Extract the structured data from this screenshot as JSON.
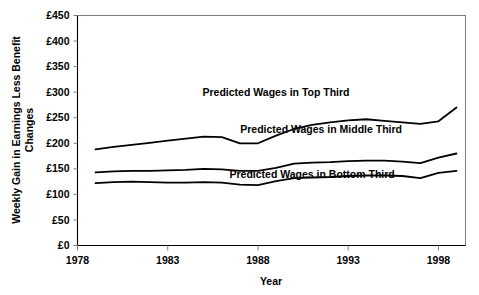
{
  "chart_data": {
    "type": "line",
    "title": "",
    "xlabel": "Year",
    "ylabel": "Weekly Gain in Earnings Less Benefit Changes",
    "ylabel_line1": "Weekly Gain in Earnings Less Benefit",
    "ylabel_line2": "Changes",
    "xlim": [
      1978,
      1999.5
    ],
    "ylim": [
      0,
      450
    ],
    "grid": false,
    "legend_position": "inline-annotations",
    "x_tick_labels": [
      "1978",
      "1983",
      "1988",
      "1993",
      "1998"
    ],
    "x_ticks": [
      1978,
      1983,
      1988,
      1993,
      1998
    ],
    "y_tick_labels": [
      "£0",
      "£50",
      "£100",
      "£150",
      "£200",
      "£250",
      "£300",
      "£350",
      "£400",
      "£450"
    ],
    "y_ticks": [
      0,
      50,
      100,
      150,
      200,
      250,
      300,
      350,
      400,
      450
    ],
    "currency_symbol": "£",
    "x": [
      1979,
      1980,
      1981,
      1982,
      1983,
      1984,
      1985,
      1986,
      1987,
      1988,
      1989,
      1990,
      1991,
      1992,
      1993,
      1994,
      1995,
      1996,
      1997,
      1998,
      1999
    ],
    "series": [
      {
        "name": "Predicted Wages in Top Third",
        "annotation": "Predicted Wages in Top Third",
        "color": "#000000",
        "values": [
          188,
          193,
          197,
          201,
          205,
          209,
          213,
          212,
          200,
          200,
          215,
          228,
          236,
          241,
          245,
          247,
          244,
          241,
          238,
          243,
          270
        ]
      },
      {
        "name": "Predicted Wages in Middle Third",
        "annotation": "Predicted Wages in Middle Third",
        "color": "#000000",
        "values": [
          143,
          145,
          146,
          146,
          147,
          148,
          150,
          149,
          146,
          146,
          152,
          160,
          162,
          163,
          165,
          166,
          166,
          164,
          161,
          172,
          180
        ]
      },
      {
        "name": "Predicted Wages in Bottom Third",
        "annotation": "Predicted Wages in Bottom Third",
        "color": "#000000",
        "values": [
          122,
          124,
          125,
          124,
          123,
          123,
          124,
          123,
          119,
          118,
          126,
          132,
          133,
          134,
          136,
          137,
          137,
          136,
          132,
          142,
          146
        ]
      }
    ],
    "annotations": [
      {
        "text": "Predicted Wages in Top Third",
        "x": 1989.0,
        "y": 300
      },
      {
        "text": "Predicted Wages in Middle Third",
        "x": 1991.5,
        "y": 228
      },
      {
        "text": "Predicted Wages in Bottom Third",
        "x": 1991.0,
        "y": 140
      }
    ]
  }
}
